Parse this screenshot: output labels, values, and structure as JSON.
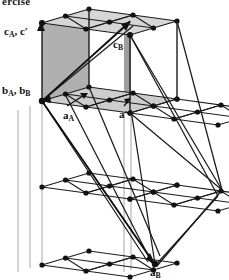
{
  "figure": {
    "kind": "crystal-lattice-diagram",
    "partial_heading": "ercise",
    "background_color": "#ffffff",
    "line_color": "#1a1a1a",
    "node_color": "#111111",
    "cell_face_fill": "#b4b4b4",
    "cell_top_fill": "#d2d2d2",
    "vertical_guide_color": "#9a9a9a"
  },
  "labels": {
    "c_A_cprime": {
      "base1": "c",
      "sub1": "A",
      "sep": ", ",
      "base2": "c",
      "prime": "′",
      "x": 4,
      "y": 28
    },
    "c_B": {
      "base": "c",
      "sub": "B",
      "x": 113,
      "y": 40
    },
    "b_A_b_B": {
      "base1": "b",
      "sub1": "A",
      "sep": ", ",
      "base2": "b",
      "sub2": "B",
      "x": 2,
      "y": 86
    },
    "a_A": {
      "base": "a",
      "sub": "A",
      "x": 63,
      "y": 111
    },
    "a_prime": {
      "base": "a",
      "prime": "′",
      "x": 119,
      "y": 110
    },
    "a_B": {
      "base": "a",
      "sub": "B",
      "x": 150,
      "y": 268
    }
  },
  "geometry": {
    "layers": [
      {
        "name": "top-layer",
        "origin_x": 40,
        "origin_y": 22
      },
      {
        "name": "second-layer",
        "origin_x": 40,
        "origin_y": 100
      },
      {
        "name": "third-layer",
        "origin_x": 40,
        "origin_y": 186
      },
      {
        "name": "bottom-layer",
        "origin_x": 40,
        "origin_y": 265
      }
    ],
    "cell_vector_a": {
      "dx": 88,
      "dy": 12
    },
    "cell_vector_b": {
      "dx": 47,
      "dy": -14
    },
    "unit_cell_height": 78,
    "rhombus_node_count_per_cell": 9
  },
  "vectors": [
    {
      "name": "c_B-arrow",
      "from": [
        42,
        101
      ],
      "to": [
        130,
        21
      ]
    },
    {
      "name": "a_B-arrow",
      "from": [
        42,
        101
      ],
      "to": [
        155,
        264
      ]
    },
    {
      "name": "c_A-arrow",
      "from": [
        41,
        34
      ],
      "to": [
        41,
        22
      ]
    }
  ]
}
